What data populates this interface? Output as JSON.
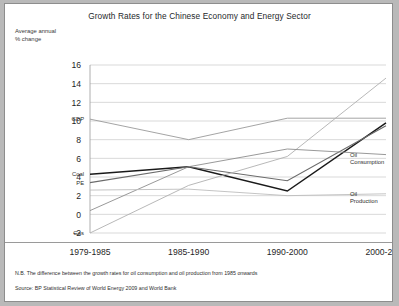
{
  "chart_data": {
    "type": "line",
    "title": "Growth Rates for the Chinese Economy and Energy Sector",
    "ylabel": "Average annual\n% change",
    "ylabel_line1": "Average annual",
    "ylabel_line2": "% change",
    "xlabel": "",
    "categories": [
      "1979-1985",
      "1985-1990",
      "1990-2000",
      "2000-2008"
    ],
    "ylim": [
      -2,
      16
    ],
    "yticks": [
      16,
      14,
      12,
      10,
      8,
      6,
      4,
      2,
      0,
      -2
    ],
    "grid": true,
    "legend_position": "inline-labels",
    "series": [
      {
        "name": "GDP",
        "label_side": "left",
        "color": "#9a9a9a",
        "width": 0.9,
        "values": [
          10.2,
          8.0,
          10.3,
          10.3
        ]
      },
      {
        "name": "Coal",
        "label_side": "left",
        "color": "#1a1a1a",
        "width": 1.5,
        "values": [
          4.3,
          5.1,
          2.5,
          9.8
        ]
      },
      {
        "name": "PE",
        "label_side": "left",
        "color": "#6b6b6b",
        "width": 1.1,
        "values": [
          3.4,
          5.1,
          3.6,
          9.5
        ]
      },
      {
        "name": "Gas",
        "label_side": "left",
        "color": "#b0b0b0",
        "width": 0.9,
        "values": [
          -2.0,
          3.1,
          6.2,
          14.6
        ]
      },
      {
        "name": "Oil Consumption",
        "label_side": "right",
        "color": "#8d8d8d",
        "width": 0.9,
        "values": [
          0.4,
          5.1,
          7.0,
          6.4
        ]
      },
      {
        "name": "Oil Production",
        "label_side": "right",
        "color": "#bdbdbd",
        "width": 0.9,
        "values": [
          2.6,
          2.7,
          2.0,
          2.2
        ]
      }
    ],
    "annotations": [
      "N.B. The difference between the growth rates for oil consumption and oil production from 1985 onwards",
      "Source: BP Statistical Review of World Energy 2009 and World Bank"
    ]
  },
  "footnotes": {
    "note": "N.B. The difference between the growth rates for oil consumption and oil production from 1985 onwards",
    "source": "Source: BP Statistical Review of World Energy 2009 and World Bank"
  }
}
